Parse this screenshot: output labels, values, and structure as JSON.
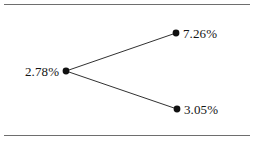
{
  "figure": {
    "background_color": "#ffffff",
    "rule_color": "#6e6e6e",
    "node_color": "#111111",
    "edge_color": "#1a1a1a"
  },
  "chart_data": {
    "type": "diagram",
    "subtype": "binomial-tree",
    "title": "",
    "xlabel": "",
    "ylabel": "",
    "grid": false,
    "legend": null,
    "nodes": [
      {
        "id": "root",
        "label": "2.78%",
        "value": 2.78,
        "unit": "%",
        "x": 66,
        "y": 71,
        "label_side": "left"
      },
      {
        "id": "up",
        "label": "7.26%",
        "value": 7.26,
        "unit": "%",
        "x": 176,
        "y": 33,
        "label_side": "right"
      },
      {
        "id": "down",
        "label": "3.05%",
        "value": 3.05,
        "unit": "%",
        "x": 177,
        "y": 109,
        "label_side": "right"
      }
    ],
    "edges": [
      {
        "from": "root",
        "to": "up"
      },
      {
        "from": "root",
        "to": "down"
      }
    ]
  },
  "rules": {
    "top_label": "top-rule",
    "bottom_label": "bottom-rule"
  }
}
